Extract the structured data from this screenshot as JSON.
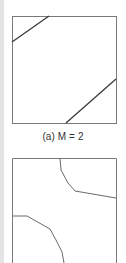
{
  "figure": {
    "panels": [
      {
        "id": "a",
        "caption": "(a) M = 2",
        "box": {
          "x": 12,
          "y": 16,
          "width": 104,
          "height": 107
        },
        "boundaries": [
          {
            "points": [
              [
                12,
                42
              ],
              [
                49,
                16
              ]
            ]
          },
          {
            "points": [
              [
                66,
                123
              ],
              [
                116,
                79
              ]
            ]
          }
        ]
      },
      {
        "id": "b",
        "caption": "",
        "box": {
          "x": 12,
          "y": 158,
          "width": 104,
          "height": 110
        },
        "boundaries": [
          {
            "points": [
              [
                60,
                158
              ],
              [
                61,
                170
              ],
              [
                68,
                183
              ],
              [
                75,
                191
              ],
              [
                116,
                198
              ]
            ]
          },
          {
            "points": [
              [
                12,
                216
              ],
              [
                27,
                216
              ],
              [
                50,
                229
              ],
              [
                56,
                240
              ],
              [
                62,
                252
              ],
              [
                64,
                263
              ]
            ]
          }
        ]
      }
    ],
    "colors": {
      "box_stroke": "#7a7a7a",
      "line_stroke_a": "#3a3a3a",
      "line_stroke_b": "#6a6a6a",
      "left_stripe": "#e4e4e4"
    }
  }
}
